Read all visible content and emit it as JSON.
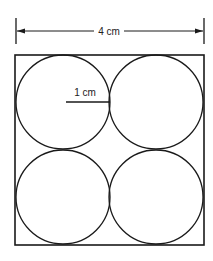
{
  "diagram": {
    "type": "geometry",
    "width_label": "4 cm",
    "radius_label": "1 cm",
    "circle_count": 4,
    "colors": {
      "stroke": "#1a1a1a",
      "background": "#ffffff"
    }
  }
}
